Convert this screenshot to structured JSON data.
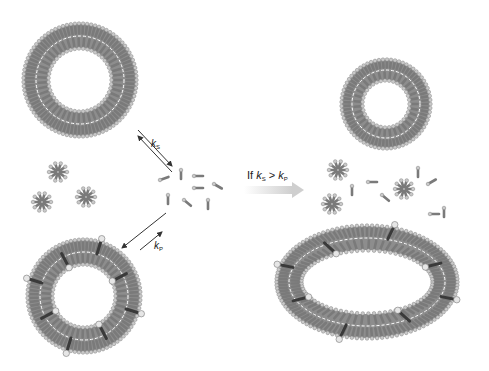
{
  "figure": {
    "labels": {
      "k_s": {
        "symbol": "k",
        "sub": "S"
      },
      "k_p": {
        "symbol": "k",
        "sub": "P"
      },
      "condition": {
        "prefix": "If ",
        "left": "k",
        "left_sub": "S",
        "op": " > ",
        "right": "k",
        "right_sub": "P"
      }
    },
    "colors": {
      "lipid_tail": "#7a7a7a",
      "lipid_head": "#c9c9c9",
      "dark_tail": "#3a3a3a",
      "arrow": "#333333",
      "gradient_arrow_start": "#ffffff",
      "gradient_arrow_end": "#cfcfcf"
    },
    "structures": [
      {
        "name": "vesicle-top-left",
        "type": "ring",
        "cx": 80,
        "cy": 80,
        "r_out": 58,
        "r_in": 30
      },
      {
        "name": "vesicle-bottom-left-mixed",
        "type": "ring",
        "cx": 84,
        "cy": 296,
        "r_out": 58,
        "r_in": 30,
        "inclusions": 8
      },
      {
        "name": "vesicle-top-right",
        "type": "ring",
        "cx": 386,
        "cy": 104,
        "r_out": 46,
        "r_in": 22
      },
      {
        "name": "vesicle-bottom-right-elongated",
        "type": "ellipse",
        "cx": 367,
        "cy": 282,
        "rx": 92,
        "ry": 58,
        "inclusions": 8
      }
    ]
  }
}
